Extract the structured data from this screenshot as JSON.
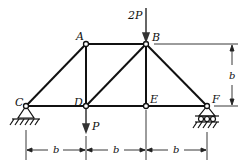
{
  "diagram": {
    "type": "truss",
    "nodes": {
      "A": {
        "label": "A",
        "x": 86,
        "y": 44
      },
      "B": {
        "label": "B",
        "x": 146,
        "y": 44
      },
      "C": {
        "label": "C",
        "x": 26,
        "y": 106
      },
      "D": {
        "label": "D",
        "x": 86,
        "y": 106
      },
      "E": {
        "label": "E",
        "x": 146,
        "y": 106
      },
      "F": {
        "label": "F",
        "x": 207,
        "y": 106
      }
    },
    "members": [
      [
        "C",
        "A"
      ],
      [
        "A",
        "B"
      ],
      [
        "B",
        "F"
      ],
      [
        "C",
        "D"
      ],
      [
        "D",
        "E"
      ],
      [
        "E",
        "F"
      ],
      [
        "A",
        "D"
      ],
      [
        "D",
        "B"
      ],
      [
        "B",
        "E"
      ]
    ],
    "loads": [
      {
        "node": "B",
        "label": "2P",
        "direction": "down"
      },
      {
        "node": "D",
        "label": "P",
        "direction": "down"
      }
    ],
    "supports": [
      {
        "node": "C",
        "type": "pin"
      },
      {
        "node": "F",
        "type": "roller"
      }
    ],
    "dimensions": {
      "horizontal": [
        "b",
        "b",
        "b"
      ],
      "vertical": "b"
    },
    "colors": {
      "line": "#111111",
      "background": "#ffffff"
    }
  }
}
